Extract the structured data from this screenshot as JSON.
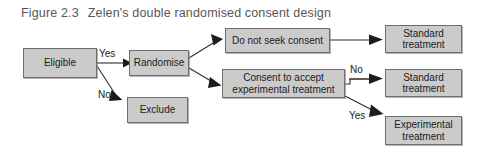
{
  "figure": {
    "number": "Figure 2.3",
    "title": "Zelen's double randomised consent design"
  },
  "nodes": {
    "eligible": "Eligible",
    "randomise": "Randomise",
    "exclude": "Exclude",
    "no_consent": "Do not seek consent",
    "consent_accept_line1": "Consent to accept",
    "consent_accept_line2": "experimental treatment",
    "standard_1_line1": "Standard",
    "standard_1_line2": "treatment",
    "standard_2_line1": "Standard",
    "standard_2_line2": "treatment",
    "experimental_line1": "Experimental",
    "experimental_line2": "treatment"
  },
  "edge_labels": {
    "yes_left": "Yes",
    "no_left": "No",
    "no_right": "No",
    "yes_right": "Yes"
  },
  "colors": {
    "node_fill": "#cbcbcb",
    "node_border": "#6e6e6e",
    "connector": "#303030",
    "caption_text": "#575757",
    "node_text": "#1b1b1b",
    "background": "#ffffff"
  }
}
